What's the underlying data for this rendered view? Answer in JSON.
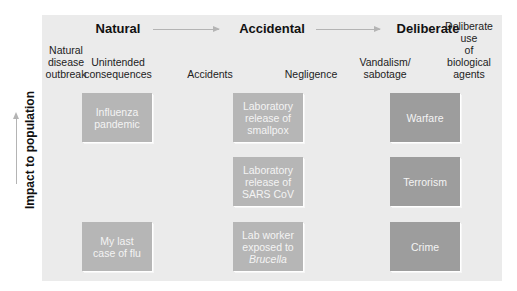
{
  "headings": {
    "natural": "Natural",
    "accidental": "Accidental",
    "deliberate": "Deliberate"
  },
  "subheadings": {
    "natural_disease": "Natural\ndisease\noutbreak",
    "unintended": "Unintended\nconsequences",
    "accidents": "Accidents",
    "negligence": "Negligence",
    "vandalism": "Vandalism/\nsabotage",
    "deliberate_use": "Deliberate use\nof biological\nagents"
  },
  "y_axis": {
    "label": "Impact to population"
  },
  "boxes": {
    "natural": [
      {
        "label": "Influenza\npandemic"
      },
      {
        "label": "My last\ncase of flu"
      }
    ],
    "accidental": [
      {
        "label": "Laboratory\nrelease of\nsmallpox"
      },
      {
        "label": "Laboratory\nrelease of\nSARS CoV"
      },
      {
        "label_prefix": "Lab worker\nexposed to\n",
        "label_italic": "Brucella"
      }
    ],
    "deliberate": [
      {
        "label": "Warfare"
      },
      {
        "label": "Terrorism"
      },
      {
        "label": "Crime"
      }
    ]
  },
  "colors": {
    "page_background": "#ffffff",
    "panel_background": "#ebebeb",
    "box_natural_accidental": "#b6b6b6",
    "box_deliberate": "#9d9d9d",
    "box_text": "#f4f4f4",
    "arrow": "#b4b4b4"
  }
}
